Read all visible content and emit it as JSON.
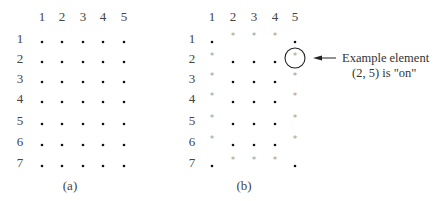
{
  "panels": [
    {
      "caption": "(a)",
      "col_labels": [
        "1",
        "2",
        "3",
        "4",
        "5"
      ],
      "row_labels": [
        "1",
        "2",
        "3",
        "4",
        "5",
        "6",
        "7"
      ],
      "grid": [
        [
          ".",
          ".",
          ".",
          ".",
          "."
        ],
        [
          ".",
          ".",
          ".",
          ".",
          "."
        ],
        [
          ".",
          ".",
          ".",
          ".",
          "."
        ],
        [
          ".",
          ".",
          ".",
          ".",
          "."
        ],
        [
          ".",
          ".",
          ".",
          ".",
          "."
        ],
        [
          ".",
          ".",
          ".",
          ".",
          "."
        ],
        [
          ".",
          ".",
          ".",
          ".",
          "."
        ]
      ]
    },
    {
      "caption": "(b)",
      "col_labels": [
        "1",
        "2",
        "3",
        "4",
        "5"
      ],
      "row_labels": [
        "1",
        "2",
        "3",
        "4",
        "5",
        "6",
        "7"
      ],
      "grid": [
        [
          ".",
          "*",
          "*",
          "*",
          "."
        ],
        [
          "*",
          ".",
          ".",
          ".",
          "*"
        ],
        [
          "*",
          ".",
          ".",
          ".",
          "*"
        ],
        [
          "*",
          ".",
          ".",
          ".",
          "*"
        ],
        [
          "*",
          ".",
          ".",
          ".",
          "*"
        ],
        [
          "*",
          ".",
          ".",
          ".",
          "*"
        ],
        [
          ".",
          "*",
          "*",
          "*",
          "."
        ]
      ],
      "highlight": {
        "row": 2,
        "col": 5
      }
    }
  ],
  "annotation": {
    "line1": "Example element",
    "line2": "(2, 5) is \"on\""
  },
  "colors": {
    "dot": "#111111",
    "star": "#999999",
    "text": "#444444"
  }
}
